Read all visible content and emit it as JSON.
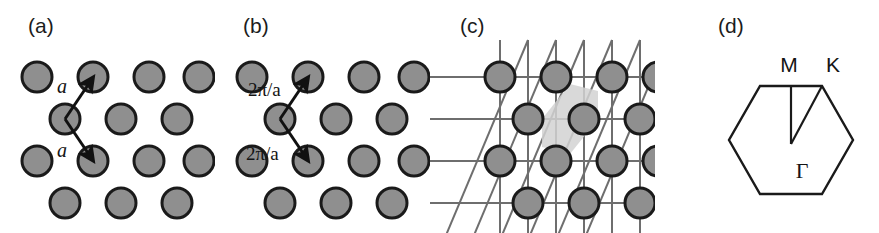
{
  "figure": {
    "width": 879,
    "height": 233,
    "background": "#ffffff"
  },
  "style": {
    "atom_fill": "#8f8f8f",
    "atom_stroke": "#1a1a1a",
    "atom_radius": 15,
    "atom_stroke_width": 3,
    "grid_line_color": "#6e6e6e",
    "grid_line_width": 2,
    "arrow_color": "#111111",
    "arrow_width": 3,
    "shade_fill": "#d2d2d2",
    "hexagon_stroke": "#1a1a1a",
    "hexagon_stroke_width": 2.4,
    "wedge_stroke": "#1a1a1a",
    "wedge_stroke_width": 2.2
  },
  "panels": [
    {
      "id": "a",
      "label": "(a)",
      "label_x": 28,
      "label_y": 30,
      "origin_x": 0,
      "type": "real-space-lattice",
      "lattice": {
        "spacing_x": 56,
        "spacing_y": 42,
        "rows": [
          {
            "y": 77,
            "xs": [
              37,
              93,
              149,
              197
            ]
          },
          {
            "y": 119,
            "xs": [
              65,
              121,
              177
            ]
          },
          {
            "y": 161,
            "xs": [
              37,
              93,
              149,
              197
            ]
          },
          {
            "y": 203,
            "xs": [
              65,
              121,
              177
            ]
          }
        ]
      },
      "vectors": [
        {
          "name": "a1",
          "label": "a",
          "label_x": 62,
          "label_y": 93,
          "x1": 65,
          "y1": 119,
          "x2": 93,
          "y2": 77
        },
        {
          "name": "a2",
          "label": "a",
          "label_x": 62,
          "label_y": 155,
          "x1": 65,
          "y1": 119,
          "x2": 93,
          "y2": 161
        }
      ]
    },
    {
      "id": "b",
      "label": "(b)",
      "label_x": 243,
      "label_y": 30,
      "origin_x": 215,
      "type": "reciprocal-space-lattice",
      "lattice": {
        "spacing_x": 56,
        "spacing_y": 42,
        "rows": [
          {
            "y": 77,
            "xs": [
              252,
              308,
              364,
              412
            ]
          },
          {
            "y": 119,
            "xs": [
              280,
              336,
              392
            ]
          },
          {
            "y": 161,
            "xs": [
              252,
              308,
              364,
              412
            ]
          },
          {
            "y": 203,
            "xs": [
              280,
              336,
              392
            ]
          }
        ]
      },
      "vectors": [
        {
          "name": "b1",
          "label": "2π/a",
          "label_x": 248,
          "label_y": 96,
          "x1": 280,
          "y1": 119,
          "x2": 308,
          "y2": 77
        },
        {
          "name": "b2",
          "label": "2π/a",
          "label_x": 246,
          "label_y": 158,
          "x1": 280,
          "y1": 119,
          "x2": 308,
          "y2": 161
        }
      ]
    },
    {
      "id": "c",
      "label": "(c)",
      "label_x": 460,
      "label_y": 30,
      "origin_x": 430,
      "type": "wigner-seitz-construction",
      "lattice": {
        "spacing_x": 56,
        "spacing_y": 42,
        "rows": [
          {
            "y": 77,
            "xs": [
              500,
              556,
              612,
              660
            ]
          },
          {
            "y": 119,
            "xs": [
              528,
              584,
              640
            ]
          },
          {
            "y": 161,
            "xs": [
              500,
              556,
              612,
              660
            ]
          },
          {
            "y": 203,
            "xs": [
              528,
              584,
              640
            ]
          }
        ]
      },
      "grid": {
        "horizontal_ys": [
          77,
          119,
          161,
          203
        ],
        "vertical_xs": [
          500,
          528,
          556,
          584,
          612,
          640,
          660
        ],
        "diagonal_note": "lines of slope -1.5 (up-right) through lattice points"
      },
      "brillouin_zone": {
        "center_x": 584,
        "center_y": 119,
        "shaded": true,
        "shape": "hexagon"
      }
    },
    {
      "id": "d",
      "label": "(d)",
      "label_x": 718,
      "label_y": 30,
      "origin_x": 655,
      "type": "brillouin-zone",
      "hexagon": {
        "center_x": 791,
        "center_y": 140,
        "radius": 62,
        "orientation": "flat-top"
      },
      "symmetry_points": [
        {
          "name": "Gamma",
          "label": "Γ",
          "x": 791,
          "y": 140,
          "label_x": 791,
          "label_y": 175
        },
        {
          "name": "M",
          "label": "M",
          "x": 791,
          "y": 86,
          "label_x": 788,
          "label_y": 68
        },
        {
          "name": "K",
          "label": "K",
          "x": 822,
          "y": 86,
          "label_x": 832,
          "label_y": 68
        }
      ],
      "wedge": {
        "name": "irreducible-wedge",
        "vertices": "Gamma-M-K"
      }
    }
  ]
}
